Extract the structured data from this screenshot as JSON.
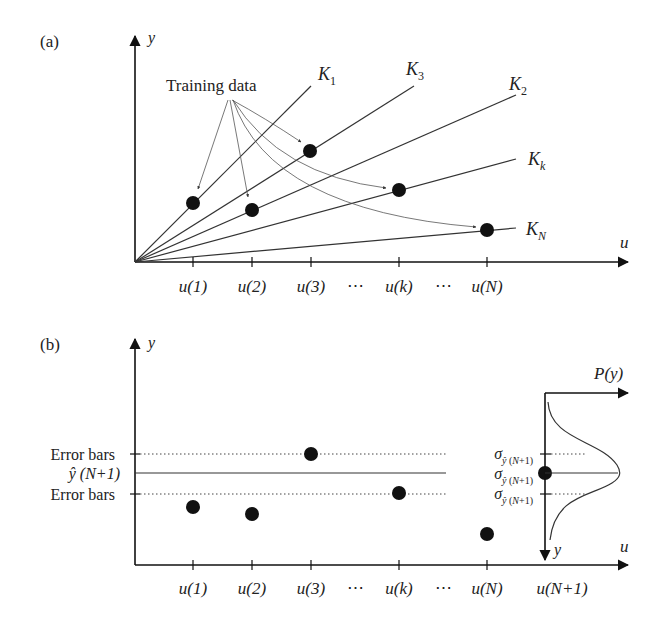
{
  "panel_a": {
    "label": "(a)",
    "y_axis_label": "y",
    "x_axis_label": "u",
    "annotation": "Training data",
    "lines": [
      {
        "name": "K",
        "sub": "1"
      },
      {
        "name": "K",
        "sub": "3"
      },
      {
        "name": "K",
        "sub": "2"
      },
      {
        "name": "K",
        "sub": "k"
      },
      {
        "name": "K",
        "sub": "N"
      }
    ],
    "ticks": [
      "u(1)",
      "u(2)",
      "u(3)",
      "⋯",
      "u(k)",
      "⋯",
      "u(N)"
    ]
  },
  "panel_b": {
    "label": "(b)",
    "y_axis_label": "y",
    "x_axis_label": "u",
    "left_labels": {
      "upper": "Error bars",
      "mean": "ŷ (N+1)",
      "lower": "Error bars"
    },
    "sigma_labels": [
      "σŷ (N+1)",
      "σŷ (N+1)",
      "σŷ (N+1)"
    ],
    "distribution_axis_label": "P(y)",
    "distribution_y_label": "y",
    "ticks": [
      "u(1)",
      "u(2)",
      "u(3)",
      "⋯",
      "u(k)",
      "⋯",
      "u(N)",
      "u(N+1)"
    ]
  },
  "colors": {
    "ink": "#111111",
    "line": "#333333",
    "arrow_thin": "#555555"
  }
}
